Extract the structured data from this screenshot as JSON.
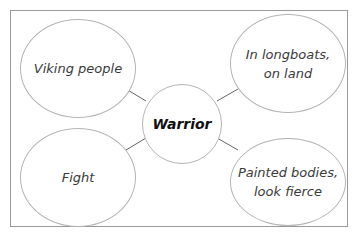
{
  "diagram": {
    "type": "mind-map",
    "center": {
      "label": "Warrior"
    },
    "nodes": [
      {
        "label": "Viking people"
      },
      {
        "label": "In longboats,\non land"
      },
      {
        "label": "Fight"
      },
      {
        "label": "Painted bodies,\nlook fierce"
      }
    ],
    "colors": {
      "border": "#b5b5b5",
      "frame": "#9a9a9a",
      "text": "#3a3a3a",
      "center_text": "#111111",
      "connector": "#555555"
    }
  }
}
